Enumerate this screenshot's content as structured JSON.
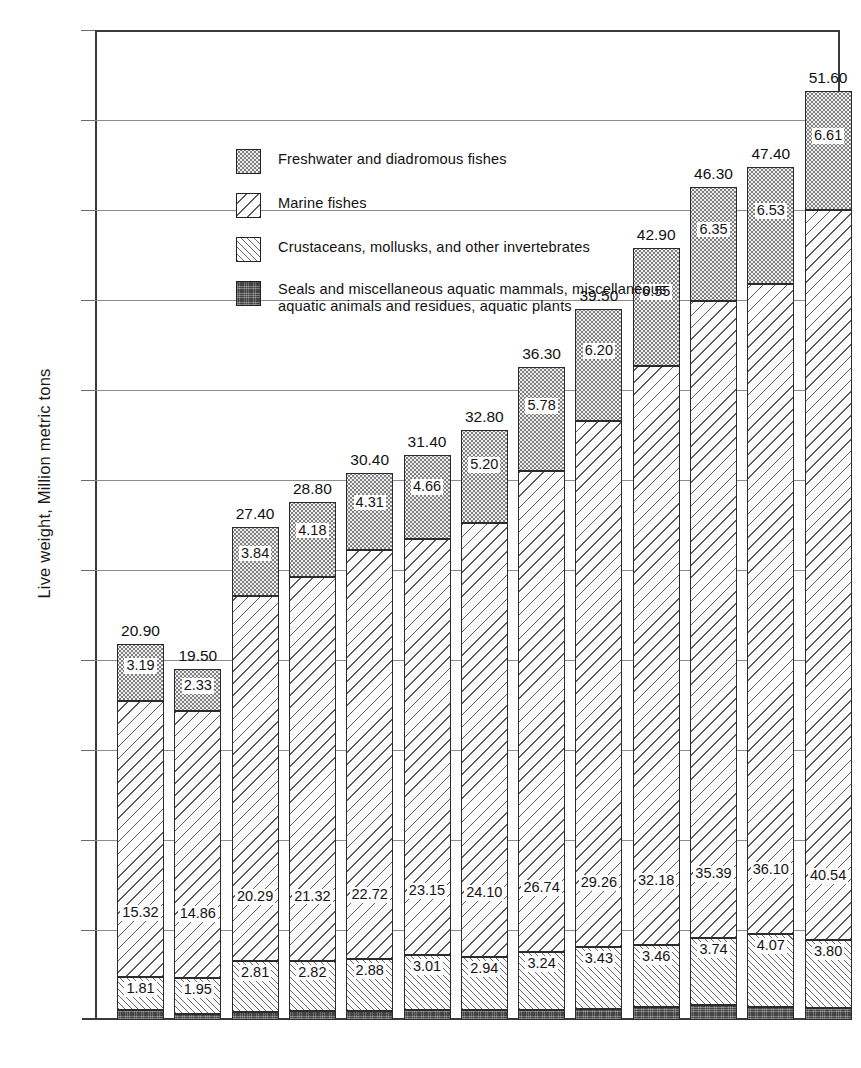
{
  "axes": {
    "ylabel": "Live weight, Million metric tons",
    "yticks": [
      "55.0",
      "50.0",
      "45.0",
      "40.0",
      "35.0",
      "30.0",
      "25.0",
      "20.0",
      "15.0",
      "10.0",
      "5.0"
    ],
    "ylim": [
      0,
      55
    ],
    "ytick_values": [
      55,
      50,
      45,
      40,
      35,
      30,
      25,
      20,
      15,
      10,
      5
    ]
  },
  "legend": [
    {
      "label": "Freshwater and diadromous fishes",
      "pattern": "stipple",
      "key": "freshwater"
    },
    {
      "label": "Marine fishes",
      "pattern": "diagonal-wide",
      "key": "marine"
    },
    {
      "label": "Crustaceans, mollusks, and other invertebrates",
      "pattern": "diagonal-fine",
      "key": "crustaceans"
    },
    {
      "label": "Seals and miscellaneous aquatic mammals, miscellaneous aquatic animals and residues, aquatic plants",
      "pattern": "solid-dark",
      "key": "misc"
    }
  ],
  "chart_data": {
    "type": "bar",
    "subtype": "stacked-vertical",
    "title": "",
    "xlabel": "",
    "ylabel": "Live weight, Million metric tons",
    "ylim": [
      0,
      55
    ],
    "yticks": [
      5,
      10,
      15,
      20,
      25,
      30,
      35,
      40,
      45,
      50,
      55
    ],
    "grid": "horizontal",
    "legend_position": "inside-upper-left",
    "categories": [
      "1938",
      "1948",
      "1954",
      "1955",
      "1956",
      "1957",
      "1958",
      "1959",
      "1960",
      "1961",
      "1962",
      "1963",
      "1964"
    ],
    "totals": [
      20.9,
      19.5,
      27.4,
      28.8,
      30.4,
      31.4,
      32.8,
      36.3,
      39.5,
      42.9,
      46.3,
      47.4,
      51.6
    ],
    "total_labels": [
      "20.90",
      "19.50",
      "27.40",
      "28.80",
      "30.40",
      "31.40",
      "32.80",
      "36.30",
      "39.50",
      "42.90",
      "46.30",
      "47.40",
      "51.60"
    ],
    "series": [
      {
        "name": "Seals and miscellaneous aquatic mammals, miscellaneous aquatic animals and residues, aquatic plants",
        "key": "misc",
        "values": [
          0.58,
          0.36,
          0.46,
          0.48,
          0.49,
          0.58,
          0.56,
          0.54,
          0.61,
          0.71,
          0.82,
          0.7,
          0.65
        ],
        "labels": [
          "0.58",
          "0.36",
          "0.46",
          "0.48",
          "0.49",
          "0.58",
          "0.56",
          "0.54",
          "0.61",
          "0.71",
          "0.82",
          "0.70",
          "0.65"
        ]
      },
      {
        "name": "Crustaceans, mollusks, and other invertebrates",
        "key": "crustaceans",
        "values": [
          1.81,
          1.95,
          2.81,
          2.82,
          2.88,
          3.01,
          2.94,
          3.24,
          3.43,
          3.46,
          3.74,
          4.07,
          3.8
        ],
        "labels": [
          "1.81",
          "1.95",
          "2.81",
          "2.82",
          "2.88",
          "3.01",
          "2.94",
          "3.24",
          "3.43",
          "3.46",
          "3.74",
          "4.07",
          "3.80"
        ]
      },
      {
        "name": "Marine fishes",
        "key": "marine",
        "values": [
          15.32,
          14.86,
          20.29,
          21.32,
          22.72,
          23.15,
          24.1,
          26.74,
          29.26,
          32.18,
          35.39,
          36.1,
          40.54
        ],
        "labels": [
          "15.32",
          "14.86",
          "20.29",
          "21.32",
          "22.72",
          "23.15",
          "24.10",
          "26.74",
          "29.26",
          "32.18",
          "35.39",
          "36.10",
          "40.54"
        ]
      },
      {
        "name": "Freshwater and diadromous fishes",
        "key": "freshwater",
        "values": [
          3.19,
          2.33,
          3.84,
          4.18,
          4.31,
          4.66,
          5.2,
          5.78,
          6.2,
          6.55,
          6.35,
          6.53,
          6.61
        ],
        "labels": [
          "3.19",
          "2.33",
          "3.84",
          "4.18",
          "4.31",
          "4.66",
          "5.20",
          "5.78",
          "6.20",
          "6.55",
          "6.35",
          "6.53",
          "6.61"
        ]
      }
    ]
  }
}
